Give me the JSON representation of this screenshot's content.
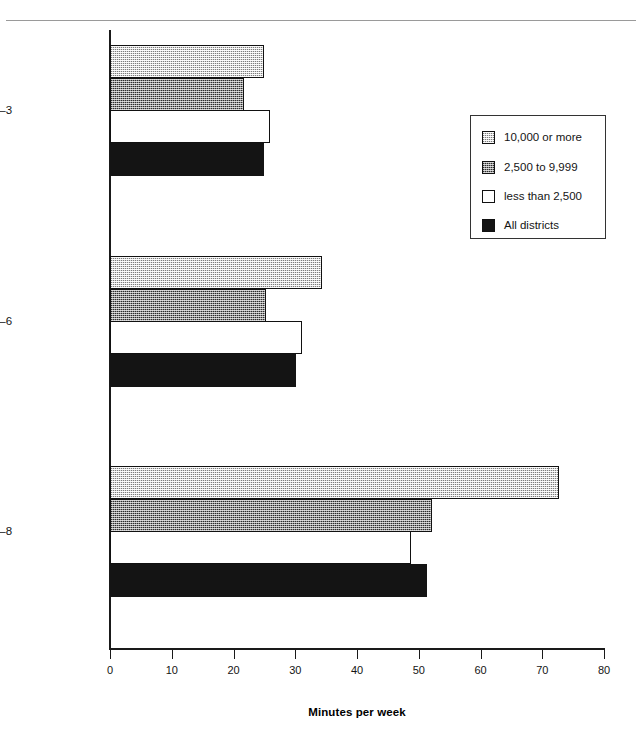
{
  "chart_data": {
    "type": "bar",
    "orientation": "horizontal",
    "title": "",
    "xlabel": "Minutes per week",
    "ylabel": "",
    "xlim": [
      0,
      80
    ],
    "xticks": [
      0,
      10,
      20,
      30,
      40,
      50,
      60,
      70,
      80
    ],
    "xtick_labels": [
      "0",
      "10",
      "20",
      "30",
      "40",
      "50",
      "60",
      "70",
      "80"
    ],
    "grid": false,
    "legend_position": "upper right",
    "categories": [
      "Grades 1–3",
      "Grades 4–6",
      "Grades 7–8"
    ],
    "series": [
      {
        "name": "10,000 or more",
        "swatch": "light-speckle",
        "values": [
          24.9,
          34.3,
          72.7
        ]
      },
      {
        "name": "2,500 to 9,999",
        "swatch": "dark-checker",
        "values": [
          21.7,
          25.3,
          52.1
        ]
      },
      {
        "name": "less than 2,500",
        "swatch": "white",
        "values": [
          25.9,
          31.1,
          48.7
        ]
      },
      {
        "name": "All districts",
        "swatch": "solid-black",
        "values": [
          24.9,
          30.1,
          51.3
        ]
      }
    ]
  },
  "axis": {
    "x_title": "Minutes per week",
    "ticks": [
      "0",
      "10",
      "20",
      "30",
      "40",
      "50",
      "60",
      "70",
      "80"
    ]
  },
  "categories": {
    "g1": "Grades 1–3",
    "g2": "Grades 4–6",
    "g3": "Grades 7–8"
  },
  "legend": {
    "items": [
      {
        "label": "10,000 or more"
      },
      {
        "label": "2,500 to 9,999"
      },
      {
        "label": "less than 2,500"
      },
      {
        "label": "All districts"
      }
    ]
  },
  "colors": {
    "light_speckle": "#d9d9d9",
    "dark_checker": "#8f8f8f",
    "white": "#ffffff",
    "solid_black": "#141414",
    "axis": "#1a1a1a"
  }
}
